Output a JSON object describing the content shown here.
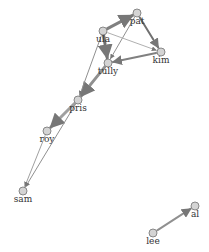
{
  "graph": {
    "nodes": [
      {
        "id": "pat",
        "label": "pat",
        "x": 137,
        "y": 13
      },
      {
        "id": "ula",
        "label": "ula",
        "x": 103,
        "y": 31
      },
      {
        "id": "kim",
        "label": "kim",
        "x": 161,
        "y": 52
      },
      {
        "id": "tully",
        "label": "tully",
        "x": 108,
        "y": 63
      },
      {
        "id": "pris",
        "label": "pris",
        "x": 78,
        "y": 100
      },
      {
        "id": "roy",
        "label": "roy",
        "x": 47,
        "y": 131
      },
      {
        "id": "sam",
        "label": "sam",
        "x": 23,
        "y": 191
      },
      {
        "id": "lee",
        "label": "lee",
        "x": 153,
        "y": 233
      },
      {
        "id": "al",
        "label": "al",
        "x": 195,
        "y": 206
      }
    ],
    "edges": [
      {
        "source": "ula",
        "target": "pat",
        "weight": 3,
        "color": "#808080"
      },
      {
        "source": "pat",
        "target": "kim",
        "weight": 2,
        "color": "#707070"
      },
      {
        "source": "pat",
        "target": "tully",
        "weight": 1,
        "color": "#909090"
      },
      {
        "source": "ula",
        "target": "tully",
        "weight": 3,
        "color": "#707070"
      },
      {
        "source": "ula",
        "target": "kim",
        "weight": 1,
        "color": "#b0b0b0"
      },
      {
        "source": "kim",
        "target": "tully",
        "weight": 2,
        "color": "#808080"
      },
      {
        "source": "tully",
        "target": "pris",
        "weight": 3,
        "color": "#909090"
      },
      {
        "source": "ula",
        "target": "pris",
        "weight": 1,
        "color": "#909090"
      },
      {
        "source": "pris",
        "target": "roy",
        "weight": 3,
        "color": "#a0a0a0"
      },
      {
        "source": "pris",
        "target": "sam",
        "weight": 1,
        "color": "#909090"
      },
      {
        "source": "roy",
        "target": "sam",
        "weight": 1,
        "color": "#a0a0a0"
      },
      {
        "source": "lee",
        "target": "al",
        "weight": 2,
        "color": "#909090"
      }
    ]
  }
}
